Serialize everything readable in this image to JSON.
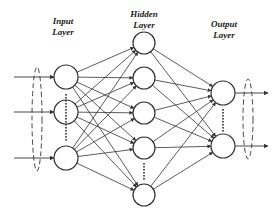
{
  "diagram": {
    "type": "neural-network",
    "colors": {
      "stroke": "#333333",
      "background": "#ffffff"
    },
    "layers": [
      {
        "id": "input",
        "label_line1": "Input",
        "label_line2": "Layer",
        "x": 66,
        "r": 12,
        "nodes": [
          77,
          112,
          158
        ],
        "ellipsis": {
          "y1": 94,
          "y2": 140
        }
      },
      {
        "id": "hidden",
        "label_line1": "Hidden",
        "label_line2": "Layer",
        "x": 144,
        "r": 11,
        "nodes": [
          43,
          78,
          113,
          148,
          195
        ],
        "ellipsis": {
          "y1": 163,
          "y2": 180
        }
      },
      {
        "id": "output",
        "label_line1": "Output",
        "label_line2": "Layer",
        "x": 223,
        "r": 12,
        "nodes": [
          93,
          146
        ],
        "ellipsis": {
          "y1": 109,
          "y2": 130
        }
      }
    ],
    "labels": {
      "input": {
        "line1": "Input",
        "line2": "Layer"
      },
      "hidden": {
        "line1": "Hidden",
        "line2": "Layer"
      },
      "output": {
        "line1": "Output",
        "line2": "Layer"
      }
    }
  }
}
